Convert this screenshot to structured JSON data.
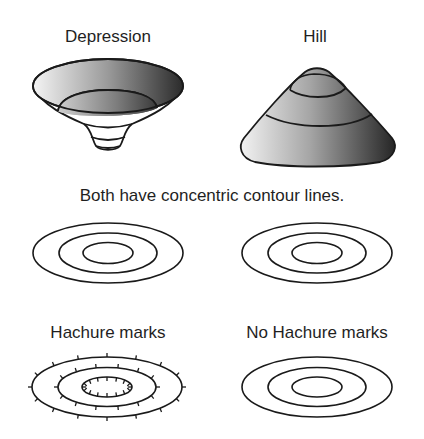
{
  "labels": {
    "depression": "Depression",
    "hill": "Hill",
    "caption": "Both have concentric contour lines.",
    "hachure": "Hachure marks",
    "no_hachure": "No Hachure marks"
  },
  "colors": {
    "stroke": "#1a1a1a",
    "shade_light": "#f2f2f2",
    "shade_dark": "#2a2a2a",
    "background": "#ffffff"
  },
  "figures": {
    "depression": {
      "type": "bowl-3d",
      "contours": 4
    },
    "hill": {
      "type": "cone-3d",
      "contours": 3
    },
    "concentric_left": {
      "rings": 3
    },
    "concentric_right": {
      "rings": 3
    },
    "hachure_map": {
      "rings": 3,
      "tick_marks": true
    },
    "no_hachure_map": {
      "rings": 3,
      "tick_marks": false
    }
  }
}
